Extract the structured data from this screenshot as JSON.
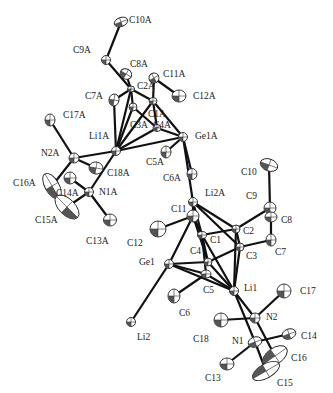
{
  "figure": {
    "type": "ORTEP crystal structure",
    "width": 333,
    "height": 393
  },
  "atoms": [
    {
      "id": "C10A",
      "x": 121,
      "y": 22,
      "rx": 7,
      "ry": 4.5,
      "rot": -20,
      "lx": 129,
      "ly": 23
    },
    {
      "id": "C9A",
      "x": 106,
      "y": 60,
      "rx": 4.5,
      "ry": 4.5,
      "rot": 0,
      "lx": 73,
      "ly": 53
    },
    {
      "id": "C8A",
      "x": 126,
      "y": 74,
      "rx": 6,
      "ry": 5,
      "rot": 30,
      "lx": 130,
      "ly": 67
    },
    {
      "id": "C11A",
      "x": 154,
      "y": 78,
      "rx": 5,
      "ry": 5,
      "rot": -30,
      "lx": 163,
      "ly": 77
    },
    {
      "id": "C12A",
      "x": 179,
      "y": 96,
      "rx": 7,
      "ry": 6,
      "rot": 0,
      "lx": 193,
      "ly": 99
    },
    {
      "id": "C2A",
      "x": 131,
      "y": 89,
      "rx": 3.5,
      "ry": 3,
      "rot": 0,
      "lx": 137,
      "ly": 89
    },
    {
      "id": "C7A",
      "x": 114,
      "y": 100,
      "rx": 5,
      "ry": 6,
      "rot": 10,
      "lx": 85,
      "ly": 99
    },
    {
      "id": "C1A",
      "x": 153,
      "y": 101,
      "rx": 4,
      "ry": 3.5,
      "rot": 0,
      "lx": 148,
      "ly": 117
    },
    {
      "id": "C3A",
      "x": 133,
      "y": 107,
      "rx": 4,
      "ry": 4,
      "rot": 0,
      "lx": 130,
      "ly": 128
    },
    {
      "id": "C4A",
      "x": 157,
      "y": 128,
      "rx": 4,
      "ry": 3.5,
      "rot": 0,
      "lx": 153,
      "ly": 128
    },
    {
      "id": "Ge1A",
      "x": 183,
      "y": 137,
      "rx": 4.5,
      "ry": 4.5,
      "rot": 0,
      "lx": 195,
      "ly": 139
    },
    {
      "id": "C17A",
      "x": 50,
      "y": 120,
      "rx": 5,
      "ry": 6,
      "rot": 0,
      "lx": 63,
      "ly": 118
    },
    {
      "id": "Li1A",
      "x": 116,
      "y": 151,
      "rx": 4.5,
      "ry": 4.5,
      "rot": 0,
      "lx": 89,
      "ly": 139
    },
    {
      "id": "N2A",
      "x": 74,
      "y": 158,
      "rx": 5,
      "ry": 5,
      "rot": 0,
      "lx": 41,
      "ly": 156
    },
    {
      "id": "C18A",
      "x": 96,
      "y": 168,
      "rx": 7,
      "ry": 6,
      "rot": 10,
      "lx": 107,
      "ly": 176
    },
    {
      "id": "C5A",
      "x": 166,
      "y": 152,
      "rx": 5,
      "ry": 6,
      "rot": 0,
      "lx": 146,
      "ly": 165
    },
    {
      "id": "C6A",
      "x": 192,
      "y": 174,
      "rx": 5,
      "ry": 5.5,
      "rot": 0,
      "lx": 163,
      "ly": 181
    },
    {
      "id": "C16A",
      "x": 52,
      "y": 186,
      "rx": 7,
      "ry": 14,
      "rot": -30,
      "lx": 13,
      "ly": 186
    },
    {
      "id": "C14A",
      "x": 70,
      "y": 178,
      "rx": 6,
      "ry": 6,
      "rot": 0,
      "lx": 56,
      "ly": 196
    },
    {
      "id": "N1A",
      "x": 89,
      "y": 192,
      "rx": 4.5,
      "ry": 4.5,
      "rot": 0,
      "lx": 99,
      "ly": 195
    },
    {
      "id": "C15A",
      "x": 67,
      "y": 207,
      "rx": 8,
      "ry": 15,
      "rot": -45,
      "lx": 35,
      "ly": 223
    },
    {
      "id": "C13A",
      "x": 110,
      "y": 220,
      "rx": 6.5,
      "ry": 6,
      "rot": 0,
      "lx": 86,
      "ly": 244
    },
    {
      "id": "Li2A",
      "x": 193,
      "y": 202,
      "rx": 4.5,
      "ry": 4.5,
      "rot": 0,
      "lx": 205,
      "ly": 196
    },
    {
      "id": "C10",
      "x": 269,
      "y": 165,
      "rx": 9,
      "ry": 6,
      "rot": 20,
      "lx": 241,
      "ly": 175
    },
    {
      "id": "C9",
      "x": 270,
      "y": 208,
      "rx": 6,
      "ry": 6,
      "rot": 0,
      "lx": 246,
      "ly": 199
    },
    {
      "id": "C8",
      "x": 271,
      "y": 217,
      "rx": 6,
      "ry": 5,
      "rot": 0,
      "lx": 281,
      "ly": 223
    },
    {
      "id": "C11",
      "x": 193,
      "y": 216,
      "rx": 6,
      "ry": 6,
      "rot": 0,
      "lx": 171,
      "ly": 212
    },
    {
      "id": "C12",
      "x": 158,
      "y": 229,
      "rx": 8,
      "ry": 8,
      "rot": 0,
      "lx": 127,
      "ly": 246
    },
    {
      "id": "C2",
      "x": 236,
      "y": 229,
      "rx": 4,
      "ry": 4,
      "rot": 0,
      "lx": 243,
      "ly": 234
    },
    {
      "id": "C1",
      "x": 202,
      "y": 235,
      "rx": 4.5,
      "ry": 3.5,
      "rot": 0,
      "lx": 210,
      "ly": 243
    },
    {
      "id": "C7",
      "x": 271,
      "y": 240,
      "rx": 5,
      "ry": 6,
      "rot": 0,
      "lx": 275,
      "ly": 255
    },
    {
      "id": "C3",
      "x": 240,
      "y": 247,
      "rx": 4,
      "ry": 4,
      "rot": 0,
      "lx": 246,
      "ly": 259
    },
    {
      "id": "C4",
      "x": 208,
      "y": 262,
      "rx": 4,
      "ry": 4,
      "rot": 0,
      "lx": 190,
      "ly": 254
    },
    {
      "id": "Ge1",
      "x": 169,
      "y": 264,
      "rx": 4.5,
      "ry": 4.5,
      "rot": 0,
      "lx": 139,
      "ly": 265
    },
    {
      "id": "C5",
      "x": 206,
      "y": 274,
      "rx": 5,
      "ry": 4,
      "rot": 0,
      "lx": 203,
      "ly": 293
    },
    {
      "id": "Li1",
      "x": 234,
      "y": 291,
      "rx": 4.5,
      "ry": 4.5,
      "rot": 0,
      "lx": 244,
      "ly": 291
    },
    {
      "id": "C6",
      "x": 174,
      "y": 296,
      "rx": 6,
      "ry": 7,
      "rot": 0,
      "lx": 179,
      "ly": 316
    },
    {
      "id": "C17",
      "x": 284,
      "y": 291,
      "rx": 7,
      "ry": 7,
      "rot": 0,
      "lx": 300,
      "ly": 294
    },
    {
      "id": "N2",
      "x": 255,
      "y": 318,
      "rx": 5,
      "ry": 5,
      "rot": 0,
      "lx": 266,
      "ly": 320
    },
    {
      "id": "C18",
      "x": 221,
      "y": 320,
      "rx": 7,
      "ry": 7,
      "rot": 0,
      "lx": 193,
      "ly": 342
    },
    {
      "id": "Li2",
      "x": 131,
      "y": 322,
      "rx": 4.5,
      "ry": 4.5,
      "rot": 0,
      "lx": 137,
      "ly": 340
    },
    {
      "id": "N1",
      "x": 255,
      "y": 342,
      "rx": 7,
      "ry": 5,
      "rot": -20,
      "lx": 232,
      "ly": 344
    },
    {
      "id": "C14",
      "x": 289,
      "y": 334,
      "rx": 7,
      "ry": 5,
      "rot": -20,
      "lx": 301,
      "ly": 339
    },
    {
      "id": "C16",
      "x": 275,
      "y": 356,
      "rx": 8,
      "ry": 14,
      "rot": 55,
      "lx": 291,
      "ly": 361
    },
    {
      "id": "C13",
      "x": 227,
      "y": 364,
      "rx": 7,
      "ry": 6,
      "rot": 0,
      "lx": 205,
      "ly": 381
    },
    {
      "id": "C15",
      "x": 266,
      "y": 371,
      "rx": 7,
      "ry": 15,
      "rot": 60,
      "lx": 277,
      "ly": 386
    }
  ],
  "bonds": [
    [
      "C10A",
      "C9A"
    ],
    [
      "C9A",
      "C2A"
    ],
    [
      "C2A",
      "C8A"
    ],
    [
      "C2A",
      "C7A"
    ],
    [
      "C2A",
      "C1A"
    ],
    [
      "C2A",
      "C3A"
    ],
    [
      "C11A",
      "C12A"
    ],
    [
      "C11A",
      "C1A"
    ],
    [
      "C1A",
      "C4A"
    ],
    [
      "C1A",
      "Ge1A"
    ],
    [
      "C3A",
      "C4A"
    ],
    [
      "C4A",
      "Ge1A"
    ],
    [
      "Li1A",
      "C2A"
    ],
    [
      "Li1A",
      "C3A"
    ],
    [
      "Li1A",
      "C1A"
    ],
    [
      "Li1A",
      "C4A"
    ],
    [
      "Li1A",
      "Ge1A"
    ],
    [
      "Li1A",
      "C7A"
    ],
    [
      "Li1A",
      "N2A"
    ],
    [
      "Li1A",
      "N1A"
    ],
    [
      "N2A",
      "C17A"
    ],
    [
      "N2A",
      "C18A"
    ],
    [
      "N2A",
      "C16A"
    ],
    [
      "N1A",
      "C14A"
    ],
    [
      "N1A",
      "C13A"
    ],
    [
      "N1A",
      "C15A"
    ],
    [
      "C16A",
      "C15A"
    ],
    [
      "Ge1A",
      "C5A"
    ],
    [
      "Ge1A",
      "C6A"
    ],
    [
      "Ge1A",
      "Li2A"
    ],
    [
      "Li2A",
      "C11"
    ],
    [
      "Li2A",
      "C1"
    ],
    [
      "Li2A",
      "C2"
    ],
    [
      "Li2A",
      "C3"
    ],
    [
      "C11",
      "C12"
    ],
    [
      "C11",
      "C1"
    ],
    [
      "C11",
      "Ge1"
    ],
    [
      "C11",
      "C4"
    ],
    [
      "C1",
      "C2"
    ],
    [
      "C1",
      "C4"
    ],
    [
      "C1",
      "Li1"
    ],
    [
      "C1",
      "C5"
    ],
    [
      "C2",
      "C9"
    ],
    [
      "C2",
      "C3"
    ],
    [
      "C2",
      "Li1"
    ],
    [
      "C9",
      "C10"
    ],
    [
      "C9",
      "C8"
    ],
    [
      "C8",
      "C7"
    ],
    [
      "C3",
      "C7"
    ],
    [
      "C4",
      "Ge1"
    ],
    [
      "C4",
      "C3"
    ],
    [
      "C4",
      "Li1"
    ],
    [
      "Ge1",
      "C5"
    ],
    [
      "Ge1",
      "Li1"
    ],
    [
      "Ge1",
      "Li2"
    ],
    [
      "C5",
      "C6"
    ],
    [
      "C5",
      "Li1"
    ],
    [
      "C3",
      "Li1"
    ],
    [
      "Li1",
      "N2"
    ],
    [
      "Li1",
      "N1"
    ],
    [
      "N2",
      "C17"
    ],
    [
      "N2",
      "C18"
    ],
    [
      "N2",
      "C16"
    ],
    [
      "N1",
      "C13"
    ],
    [
      "N1",
      "C14"
    ],
    [
      "N1",
      "C15"
    ],
    [
      "C16",
      "C15"
    ]
  ]
}
